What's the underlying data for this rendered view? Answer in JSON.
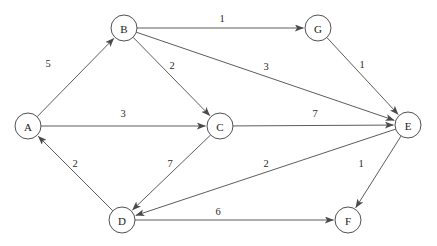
{
  "diagram": {
    "type": "directed-weighted-graph",
    "canvas": {
      "width": 437,
      "height": 246,
      "background": "#ffffff"
    },
    "style": {
      "node_stroke": "#3d3d3d",
      "node_fill": "#ffffff",
      "edge_stroke": "#4a4a4a",
      "label_color": "#1a1a1a",
      "node_radius": 13
    },
    "nodes": [
      {
        "id": "A",
        "label": "A",
        "x": 28,
        "y": 126
      },
      {
        "id": "B",
        "label": "B",
        "x": 124,
        "y": 28
      },
      {
        "id": "C",
        "label": "C",
        "x": 220,
        "y": 126
      },
      {
        "id": "D",
        "label": "D",
        "x": 122,
        "y": 220
      },
      {
        "id": "E",
        "label": "E",
        "x": 408,
        "y": 125
      },
      {
        "id": "F",
        "label": "F",
        "x": 348,
        "y": 220
      },
      {
        "id": "G",
        "label": "G",
        "x": 318,
        "y": 28
      }
    ],
    "edges": [
      {
        "id": "A-B",
        "from": "A",
        "to": "B",
        "weight": "5",
        "label_x": 48,
        "label_y": 63
      },
      {
        "id": "A-C",
        "from": "A",
        "to": "C",
        "weight": "3",
        "label_x": 123,
        "label_y": 113
      },
      {
        "id": "B-G",
        "from": "B",
        "to": "G",
        "weight": "1",
        "label_x": 222,
        "label_y": 18
      },
      {
        "id": "B-C",
        "from": "B",
        "to": "C",
        "weight": "2",
        "label_x": 172,
        "label_y": 65
      },
      {
        "id": "B-E",
        "from": "B",
        "to": "E",
        "weight": "3",
        "label_x": 266,
        "label_y": 66
      },
      {
        "id": "G-E",
        "from": "G",
        "to": "E",
        "weight": "1",
        "label_x": 362,
        "label_y": 64
      },
      {
        "id": "C-E",
        "from": "C",
        "to": "E",
        "weight": "7",
        "label_x": 315,
        "label_y": 113
      },
      {
        "id": "C-D",
        "from": "C",
        "to": "D",
        "weight": "7",
        "label_x": 170,
        "label_y": 163
      },
      {
        "id": "D-A",
        "from": "D",
        "to": "A",
        "weight": "2",
        "label_x": 75,
        "label_y": 163
      },
      {
        "id": "E-D",
        "from": "E",
        "to": "D",
        "weight": "2",
        "label_x": 266,
        "label_y": 163
      },
      {
        "id": "E-F",
        "from": "E",
        "to": "F",
        "weight": "1",
        "label_x": 361,
        "label_y": 163
      },
      {
        "id": "D-F",
        "from": "D",
        "to": "F",
        "weight": "6",
        "label_x": 218,
        "label_y": 211
      }
    ]
  }
}
